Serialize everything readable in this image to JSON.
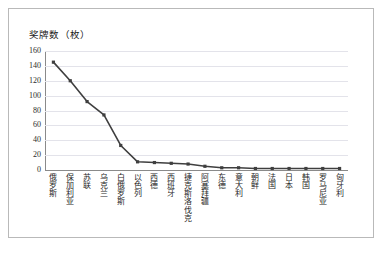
{
  "figure": {
    "axis_title": "奖牌数（枚）",
    "border_color": "#b9b9b9",
    "background": "#ffffff"
  },
  "chart_data": {
    "type": "line",
    "title": "奖牌数（枚）",
    "xlabel": "",
    "ylabel": "奖牌数（枚）",
    "ylim": [
      0,
      160
    ],
    "yticks": [
      0,
      20,
      40,
      60,
      80,
      100,
      120,
      140,
      160
    ],
    "grid": true,
    "legend": false,
    "marker": "square",
    "line_color": "#3f3f3f",
    "marker_color": "#3f3f3f",
    "categories": [
      "俄罗斯",
      "保加利亚",
      "苏联",
      "乌克兰",
      "白俄罗斯",
      "以色列",
      "西德",
      "西班牙",
      "捷克斯洛伐克",
      "阿塞拜疆",
      "东德",
      "意大利",
      "朝鲜",
      "法国",
      "日本",
      "韩国",
      "罗马尼亚",
      "匈牙利"
    ],
    "values": [
      145,
      120,
      92,
      74,
      33,
      11,
      10,
      9,
      8,
      5,
      3,
      3,
      2,
      2,
      2,
      2,
      2,
      2
    ]
  }
}
